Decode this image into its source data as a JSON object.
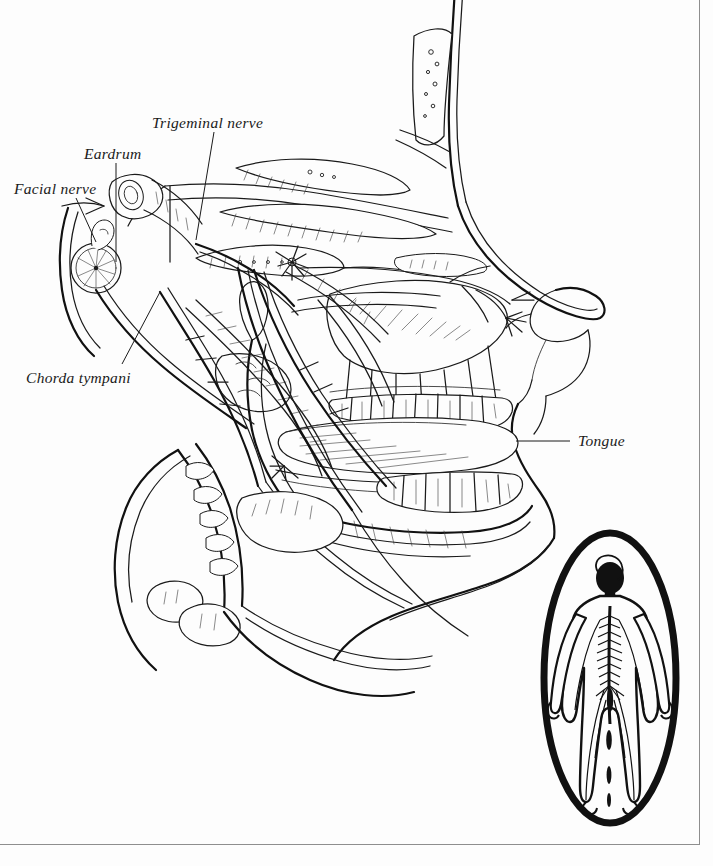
{
  "figure": {
    "type": "anatomical-line-drawing",
    "view": "lateral / mid-sagittal profile facing right",
    "background_color": "#fdfdfd",
    "ink_color": "#1a1a1a",
    "frame_color": "#8e8e8e"
  },
  "labels": [
    {
      "id": "facial-nerve",
      "text": "Facial nerve",
      "x": 14,
      "y": 180,
      "leader": {
        "from_x": 76,
        "from_y": 198,
        "to_x": 96,
        "to_y": 240
      }
    },
    {
      "id": "eardrum",
      "text": "Eardrum",
      "x": 84,
      "y": 145,
      "leader": {
        "from_x": 116,
        "top_y": 163,
        "to_x": 116,
        "to_y": 265
      }
    },
    {
      "id": "trigeminal-nerve",
      "text": "Trigeminal nerve",
      "x": 152,
      "y": 114,
      "leader": {
        "from_x": 214,
        "from_y": 132,
        "to_x": 196,
        "to_y": 238
      }
    },
    {
      "id": "chorda-tympani",
      "text": "Chorda tympani",
      "x": 26,
      "y": 369,
      "leader": {
        "from_x": 122,
        "from_y": 365,
        "to_x": 158,
        "to_y": 292
      }
    },
    {
      "id": "tongue",
      "text": "Tongue",
      "x": 578,
      "y": 432,
      "leader": {
        "from_x": 570,
        "from_y": 441,
        "to_x": 516,
        "to_y": 441
      }
    }
  ],
  "inset": {
    "name": "whole-body nervous system",
    "description": "Oval vignette containing a front-facing human figure with brain, spinal cord and peripheral nerves drawn in",
    "oval": {
      "cx": 610,
      "cy": 678,
      "rx": 66,
      "ry": 145
    },
    "oval_stroke_width": 7,
    "body": {
      "head_fill": "#111111",
      "outline_color": "#111111",
      "nerves_color": "#111111"
    }
  },
  "structures": [
    "nasal cavity and turbinates",
    "nasal septum",
    "external nose profile",
    "hard palate",
    "upper teeth",
    "lower teeth",
    "tongue",
    "mandible",
    "cranial base and sphenoid",
    "auditory canal",
    "tympanic membrane",
    "facial nerve trunk",
    "chorda tympani branch",
    "trigeminal nerve and branches",
    "lingual nerve",
    "pterygoid musculature",
    "hyoid region",
    "cervical vertebrae"
  ]
}
